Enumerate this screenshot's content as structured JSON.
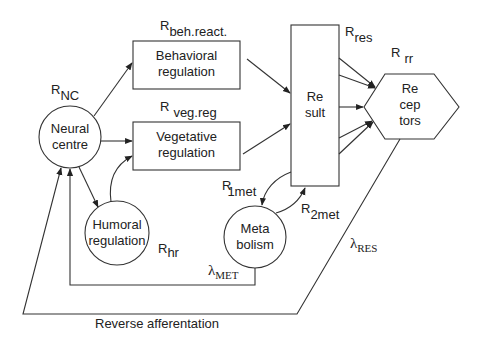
{
  "diagram": {
    "nodes": {
      "neural_centre": {
        "line1": "Neural",
        "line2": "centre",
        "shape": "circle"
      },
      "behavioral": {
        "line1": "Behavioral",
        "line2": "regulation",
        "shape": "rectangle"
      },
      "vegetative": {
        "line1": "Vegetative",
        "line2": "regulation",
        "shape": "rectangle"
      },
      "humoral": {
        "line1": "Humoral",
        "line2": "regulation",
        "shape": "circle"
      },
      "result": {
        "line1": "Re",
        "line2": "sult",
        "shape": "rectangle"
      },
      "receptors": {
        "line1": "Re",
        "line2": "cep",
        "line3": "tors",
        "shape": "hexagon"
      },
      "metabolism": {
        "line1": "Meta",
        "line2": "bolism",
        "shape": "circle"
      }
    },
    "labels": {
      "r_nc": {
        "main": "R",
        "sub": "NC"
      },
      "r_beh": {
        "main": "R",
        "sub": "beh.react."
      },
      "r_veg": {
        "main": "R",
        "sub": "veg.reg"
      },
      "r_res": {
        "main": "R",
        "sub": "res"
      },
      "r_rr": {
        "main": "R",
        "sub": "rr"
      },
      "r_1met": {
        "main": "R",
        "sub": "1met"
      },
      "r_2met": {
        "main": "R",
        "sub": "2met"
      },
      "r_hr": {
        "main": "R",
        "sub": "hr"
      },
      "lambda_met": {
        "main": "λ",
        "sub": "MET"
      },
      "lambda_res": {
        "main": "λ",
        "sub": "RES"
      },
      "reverse_afferentation": "Reverse afferentation"
    },
    "edges": [
      {
        "from": "neural_centre",
        "to": "behavioral"
      },
      {
        "from": "neural_centre",
        "to": "vegetative"
      },
      {
        "from": "neural_centre",
        "to": "humoral"
      },
      {
        "from": "humoral",
        "to": "vegetative"
      },
      {
        "from": "behavioral",
        "to": "result"
      },
      {
        "from": "vegetative",
        "to": "result"
      },
      {
        "from": "result",
        "to": "receptors",
        "count": 5
      },
      {
        "from": "result",
        "to": "metabolism",
        "label": "R1met"
      },
      {
        "from": "metabolism",
        "to": "result",
        "label": "R2met"
      },
      {
        "from": "metabolism",
        "to": "neural_centre",
        "label": "λMET"
      },
      {
        "from": "receptors",
        "to": "neural_centre",
        "label": "λRES / Reverse afferentation"
      }
    ],
    "colors": {
      "stroke": "#333333",
      "text": "#222222",
      "background": "#ffffff"
    }
  }
}
